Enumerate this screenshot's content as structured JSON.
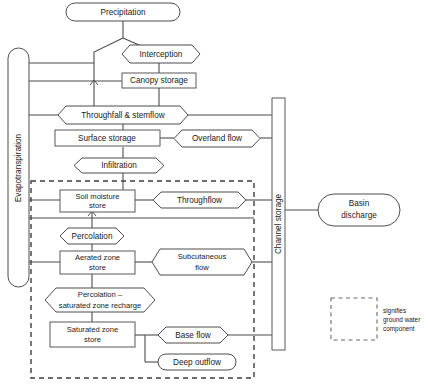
{
  "diagram": {
    "nodes": {
      "precipitation": {
        "label": "Precipitation",
        "shape": "stadium"
      },
      "interception": {
        "label": "Interception",
        "shape": "hexagon"
      },
      "canopy_storage": {
        "label": "Canopy storage",
        "shape": "rect"
      },
      "throughfall_stemflow": {
        "label": "Throughfall & stemflow",
        "shape": "hexagon"
      },
      "surface_storage": {
        "label": "Surface storage",
        "shape": "rect"
      },
      "overland_flow": {
        "label": "Overland flow",
        "shape": "hexagon"
      },
      "infiltration": {
        "label": "Infiltration",
        "shape": "hexagon"
      },
      "soil_moisture_store": {
        "label_line1": "Soil moisture",
        "label_line2": "store",
        "shape": "rect"
      },
      "throughflow": {
        "label": "Throughflow",
        "shape": "hexagon"
      },
      "percolation": {
        "label": "Percolation",
        "shape": "hexagon"
      },
      "aerated_zone_store": {
        "label_line1": "Aerated zone",
        "label_line2": "store",
        "shape": "rect"
      },
      "subcutaneous_flow": {
        "label_line1": "Subcutaneous",
        "label_line2": "flow",
        "shape": "hexagon"
      },
      "percolation_recharge": {
        "label_line1": "Percolation –",
        "label_line2": "saturated zone recharge",
        "shape": "hexagon"
      },
      "saturated_zone_store": {
        "label_line1": "Saturated zone",
        "label_line2": "store",
        "shape": "rect"
      },
      "base_flow": {
        "label": "Base flow",
        "shape": "hexagon"
      },
      "deep_outflow": {
        "label": "Deep outflow",
        "shape": "stadium"
      },
      "evapotranspiration": {
        "label": "Evapotranspiration",
        "shape": "stadium-vertical"
      },
      "channel_storage": {
        "label": "Channel storage",
        "shape": "rect-vertical"
      },
      "basin_discharge": {
        "label_line1": "Basin",
        "label_line2": "discharge",
        "shape": "stadium"
      }
    },
    "legend": {
      "line1": "signifies",
      "line2": "ground water",
      "line3": "component"
    },
    "colors": {
      "stroke": "#4d4d4d",
      "text": "#1a1a1a",
      "background": "#ffffff",
      "dashed": "#3d3d3d"
    }
  }
}
